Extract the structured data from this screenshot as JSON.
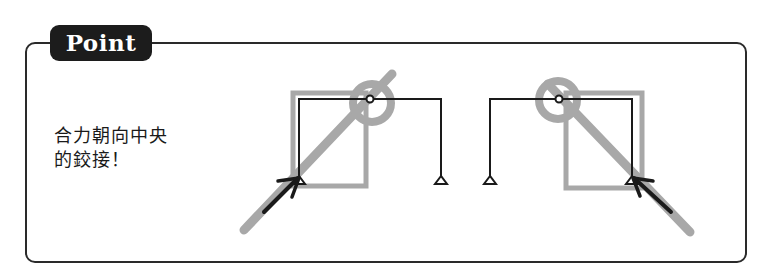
{
  "panel": {
    "tag_label": "Point",
    "note_lines": [
      "合力朝向中央",
      "的鉸接！"
    ]
  },
  "diagrams": [
    {
      "name": "left-three-hinged-frame",
      "description": "Three-hinged frame with inclined load arrow at left column base, resultant line passing through the central hinge"
    },
    {
      "name": "right-three-hinged-frame",
      "description": "Mirrored three-hinged frame with inclined load arrow at right column base, resultant line passing through the central hinge"
    }
  ],
  "colors": {
    "frame": "#1a1a1a",
    "highlight_gray": "#a8a8a8",
    "tag_bg": "#1c1c1c",
    "tag_text": "#ffffff"
  }
}
